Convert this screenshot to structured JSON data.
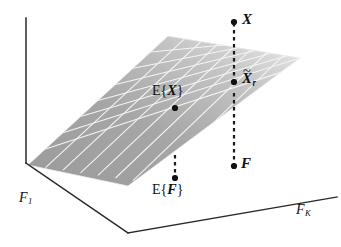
{
  "figure": {
    "type": "3d-subspace-diagram",
    "background_color": "#ffffff",
    "axes": {
      "vertical_axis": {
        "name": "vertical-axis",
        "from": [
          26,
          163
        ],
        "to": [
          26,
          18
        ]
      },
      "left_axis": {
        "label_plain": "F_1",
        "base": "F",
        "subscript": "1",
        "from": [
          26,
          163
        ],
        "to": [
          128,
          233
        ]
      },
      "right_axis": {
        "label_plain": "F_K",
        "base": "F",
        "subscript": "K",
        "from": [
          128,
          233
        ],
        "to": [
          337,
          197
        ]
      }
    },
    "plane": {
      "name": "signal-subspace-plane",
      "fill_dark": "#9d9d9d",
      "fill_light": "#d8d8d8",
      "grid_line_color": "#f2f2f2",
      "corners": [
        [
          28,
          165
        ],
        [
          168,
          36
        ],
        [
          300,
          58
        ],
        [
          128,
          186
        ]
      ]
    },
    "points": [
      {
        "id": "X",
        "label_base": "X",
        "label_plain": "X",
        "tilde": false,
        "subscript": "",
        "x": 234,
        "y": 22,
        "dot_radius": 3.1
      },
      {
        "id": "Xr",
        "label_base": "X",
        "label_plain": "X~_r",
        "tilde": true,
        "subscript": "r",
        "x": 234,
        "y": 82,
        "dot_radius": 3.1
      },
      {
        "id": "EX",
        "label_plain": "E{X}",
        "prefix": "E",
        "open": "{",
        "inner": "X",
        "close": "}",
        "x": 175,
        "y": 108,
        "dot_radius": 3.1
      },
      {
        "id": "F",
        "label_base": "F",
        "label_plain": "F",
        "tilde": false,
        "subscript": "",
        "x": 234,
        "y": 166,
        "dot_radius": 3.1
      },
      {
        "id": "EF",
        "label_plain": "E{F}",
        "prefix": "E",
        "open": "{",
        "inner": "F",
        "close": "}",
        "x": 175,
        "y": 178,
        "dot_radius": 3.1
      }
    ],
    "dashed_connectors": [
      {
        "name": "x-to-xr-dashed",
        "from": [
          234,
          22
        ],
        "to": [
          234,
          82
        ]
      },
      {
        "name": "xr-to-f-dashed",
        "from": [
          234,
          92
        ],
        "to": [
          234,
          166
        ]
      },
      {
        "name": "ex-to-ef-dashed",
        "from": [
          175,
          155
        ],
        "to": [
          175,
          178
        ]
      }
    ],
    "labels": {
      "X": "X",
      "Xr_base": "X",
      "Xr_tilde": "~",
      "Xr_sub": "r",
      "EX_prefix": "E",
      "EX_open": "{",
      "EX_inner": "X",
      "EX_close": "}",
      "F": "F",
      "EF_prefix": "E",
      "EF_open": "{",
      "EF_inner": "F",
      "EF_close": "}",
      "axis_left_base": "F",
      "axis_left_sub": "1",
      "axis_right_base": "F",
      "axis_right_sub": "K"
    }
  }
}
